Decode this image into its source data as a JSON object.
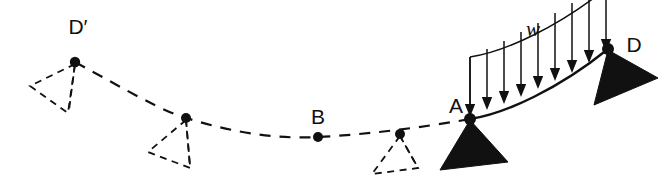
{
  "figure": {
    "kind": "structural-beam-deflection-diagram",
    "background_color": "#ffffff",
    "ink_color": "#111111",
    "width": 670,
    "height": 194
  },
  "labels": {
    "d_prime": "D′",
    "b": "B",
    "a": "A",
    "d": "D",
    "w": "w"
  },
  "nodes": [
    {
      "id": "d-prime",
      "label": "D′",
      "x": 75,
      "y": 62,
      "radius": 5.2,
      "has_support": true,
      "support_style": "dashed"
    },
    {
      "id": "node-2",
      "label": "",
      "x": 186,
      "y": 118,
      "radius": 5.0,
      "has_support": true,
      "support_style": "dashed"
    },
    {
      "id": "b",
      "label": "B",
      "x": 318,
      "y": 137,
      "radius": 5.0,
      "has_support": false,
      "support_style": "none"
    },
    {
      "id": "node-4",
      "label": "",
      "x": 400,
      "y": 134,
      "radius": 5.0,
      "has_support": true,
      "support_style": "dashed"
    },
    {
      "id": "a",
      "label": "A",
      "x": 470,
      "y": 119,
      "radius": 6.0,
      "has_support": true,
      "support_style": "solid"
    },
    {
      "id": "d",
      "label": "D",
      "x": 608,
      "y": 49,
      "radius": 6.0,
      "has_support": true,
      "support_style": "solid-rotated"
    }
  ],
  "deflected_shape": {
    "description": "dashed deflected curve from D-prime through B to A",
    "path": "M 75 62 C 130 92, 160 110, 186 118 C 238 134, 278 139, 318 137 C 360 135, 420 128, 470 119",
    "dash_pattern": "11 9",
    "stroke_width": 2.2
  },
  "beam_segment": {
    "description": "solid loaded beam curve from A up to D",
    "path": "M 470 119 C 505 114, 560 88, 608 49",
    "stroke_width": 2.4
  },
  "distributed_load": {
    "symbol": "w",
    "symbol_x": 533,
    "symbol_y": 36,
    "top_path": "M 470 57 C 505 52, 560 26, 608 -13",
    "left_edge": {
      "x1": 470,
      "y1": 57,
      "x2": 470,
      "y2": 119
    },
    "arrow_count": 9,
    "arrows": [
      {
        "x_top": 470,
        "y_top": 57,
        "x_tip": 470,
        "y_tip": 117
      },
      {
        "x_top": 487,
        "y_top": 49,
        "x_tip": 487,
        "y_tip": 110
      },
      {
        "x_top": 504,
        "y_top": 41,
        "x_tip": 504,
        "y_tip": 104
      },
      {
        "x_top": 521,
        "y_top": 32,
        "x_tip": 521,
        "y_tip": 97
      },
      {
        "x_top": 538,
        "y_top": 23,
        "x_tip": 538,
        "y_tip": 89
      },
      {
        "x_top": 555,
        "y_top": 13,
        "x_tip": 555,
        "y_tip": 81
      },
      {
        "x_top": 572,
        "y_top": 3,
        "x_tip": 572,
        "y_tip": 73
      },
      {
        "x_top": 589,
        "y_top": -6,
        "x_tip": 589,
        "y_tip": 63
      },
      {
        "x_top": 606,
        "y_top": -14,
        "x_tip": 606,
        "y_tip": 52
      }
    ]
  },
  "supports": {
    "dashed_triangles": [
      {
        "node": "d-prime",
        "points": "75,64 30,86 68,113",
        "apex_tick": {
          "x1": 75,
          "y1": 64,
          "x2": 69,
          "y2": 110
        }
      },
      {
        "node": "node-2",
        "points": "186,120 148,152 190,168",
        "apex_tick": {
          "x1": 186,
          "y1": 120,
          "x2": 190,
          "y2": 165
        }
      },
      {
        "node": "node-4",
        "points": "400,136 372,174 418,168",
        "apex_tick": {
          "x1": 400,
          "y1": 136,
          "x2": 417,
          "y2": 166
        }
      }
    ],
    "solid_triangles": [
      {
        "node": "a",
        "points": "470,120 440,170 508,162"
      },
      {
        "node": "d",
        "points": "608,50 594,105 658,78"
      }
    ]
  },
  "label_positions": {
    "d_prime": {
      "x": 78,
      "y": 34,
      "anchor": "middle"
    },
    "b": {
      "x": 318,
      "y": 124,
      "anchor": "middle"
    },
    "a": {
      "x": 456,
      "y": 113,
      "anchor": "middle"
    },
    "d": {
      "x": 634,
      "y": 52,
      "anchor": "middle"
    },
    "w": {
      "x": 533,
      "y": 36,
      "anchor": "middle"
    }
  }
}
